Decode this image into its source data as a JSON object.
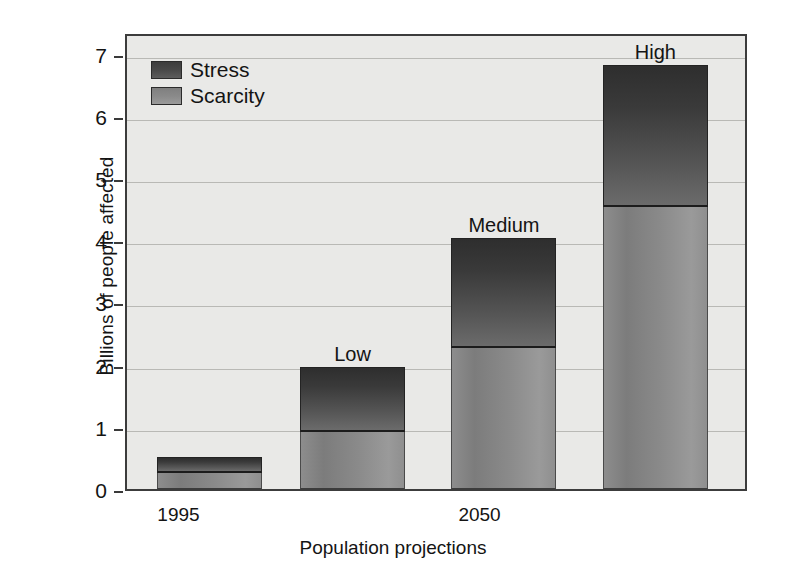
{
  "chart_data": {
    "type": "bar",
    "subtype": "stacked-bar",
    "title": "",
    "xlabel": "Population projections",
    "ylabel": "Billions of people affected",
    "ylim": [
      0,
      7.35
    ],
    "yticks": [
      0,
      1,
      2,
      3,
      4,
      5,
      6,
      7
    ],
    "ytick_labels": [
      "0",
      "1",
      "2",
      "3",
      "4",
      "5",
      "6",
      "7"
    ],
    "grid": true,
    "grid_axis": "y",
    "categories": [
      "1995",
      "Low",
      "Medium",
      "High"
    ],
    "xtick_labels": [
      "1995",
      "2050"
    ],
    "bar_labels": [
      "",
      "Low",
      "Medium",
      "High"
    ],
    "legend": {
      "position": "top-left-inside",
      "entries": [
        {
          "name": "Stress",
          "color": "#3f3f3f"
        },
        {
          "name": "Scarcity",
          "color": "#8b8b8b"
        }
      ]
    },
    "series": [
      {
        "name": "Scarcity",
        "color": "#8b8b8b",
        "values": [
          0.25,
          0.92,
          2.27,
          4.53
        ]
      },
      {
        "name": "Stress",
        "color": "#3f3f3f",
        "values": [
          0.26,
          1.05,
          1.76,
          2.29
        ]
      }
    ],
    "cumulative_tops": [
      0.51,
      1.97,
      4.03,
      6.82
    ],
    "annotations": []
  },
  "axes": {
    "ylabel": "Billions of people affected",
    "xlabel": "Population projections",
    "yticks": [
      "7",
      "6",
      "5",
      "4",
      "3",
      "2",
      "1",
      "0"
    ],
    "xticks": [
      {
        "label": "1995",
        "center_pct": 8.6
      },
      {
        "label": "2050",
        "center_pct": 57.0
      }
    ]
  },
  "legend": {
    "stress_label": "Stress",
    "scarcity_label": "Scarcity"
  },
  "bars": [
    {
      "label": "",
      "scarcity": 0.25,
      "stress_top": 0.51,
      "left_pct": 4.8,
      "width_pct": 17.0
    },
    {
      "label": "Low",
      "scarcity": 0.92,
      "stress_top": 1.97,
      "left_pct": 28.0,
      "width_pct": 17.0
    },
    {
      "label": "Medium",
      "scarcity": 2.27,
      "stress_top": 4.03,
      "left_pct": 52.5,
      "width_pct": 17.0
    },
    {
      "label": "High",
      "scarcity": 4.53,
      "stress_top": 6.82,
      "left_pct": 77.0,
      "width_pct": 17.0
    }
  ]
}
